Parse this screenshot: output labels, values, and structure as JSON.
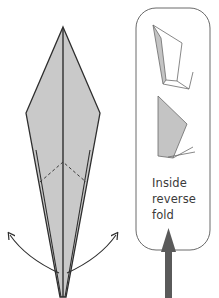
{
  "diagram": {
    "type": "origami-instruction",
    "callout": {
      "label_lines": [
        "Inside",
        "reverse",
        "fold"
      ]
    },
    "colors": {
      "paper_fill": "#c9c9c9",
      "paper_fill_light": "#d6d6d6",
      "outline": "#2e2e2e",
      "callout_border": "#6a6a6a",
      "push_arrow": "#5a5a5a"
    },
    "elements": [
      "kite-shaped folded model",
      "center crease",
      "dashed valley fold chevron",
      "left curved swing arrow",
      "right curved swing arrow",
      "callout box",
      "sketch: reverse fold in progress",
      "sketch: reverse fold completed",
      "push-up arrow"
    ]
  }
}
